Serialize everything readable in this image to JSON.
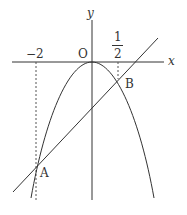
{
  "diagram": {
    "axes": {
      "x_label": "x",
      "y_label": "y",
      "origin_label": "O"
    },
    "ticks": {
      "neg2": "−2",
      "half_num": "1",
      "half_den": "2"
    },
    "points": {
      "A": "A",
      "B": "B"
    },
    "curves": [
      "parabola y = -ax^2 (vertex at O)",
      "line through A and B"
    ],
    "colors": {
      "stroke": "#333333",
      "dashed": "#555555"
    }
  }
}
